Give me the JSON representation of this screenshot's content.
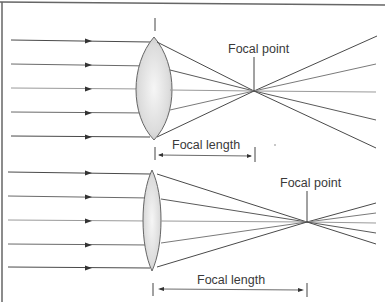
{
  "diagram": {
    "panels": [
      {
        "id": "thick-lens",
        "focal_point_label": "Focal point",
        "focal_length_label": "Focal length",
        "lens_type": "thick convex lens",
        "ray_count": 5
      },
      {
        "id": "thin-lens",
        "focal_point_label": "Focal point",
        "focal_length_label": "Focal length",
        "lens_type": "thin convex lens",
        "ray_count": 5
      }
    ],
    "colors": {
      "ray_dark": "#4a4a4a",
      "ray_light": "#9a9a9a",
      "border": "#555555",
      "lens_fill": "#e4e4e4",
      "text": "#3a3a3a"
    }
  }
}
